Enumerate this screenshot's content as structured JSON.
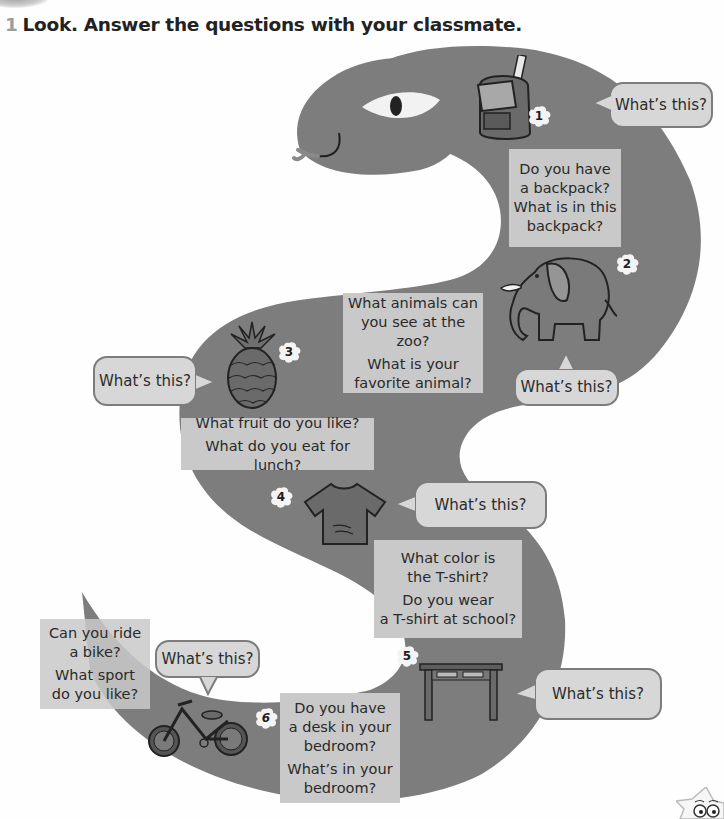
{
  "exercise": {
    "number": "1",
    "instruction": "Look. Answer the questions with your classmate."
  },
  "colors": {
    "snake_body": "#7d7d7d",
    "question_box": "#c9c9c9",
    "bubble_fill": "#d7d7d7",
    "bubble_border": "#7c7c7c",
    "number_color": "#9d9d9d"
  },
  "stations": [
    {
      "number": "1",
      "item": "backpack",
      "bubble": "What’s this?",
      "questions": [
        "Do you have a backpack? What is in this backpack?"
      ]
    },
    {
      "number": "2",
      "item": "elephant",
      "bubble": "What’s this?",
      "questions": [
        "What animals can you see at the zoo?",
        "What is your favorite animal?"
      ]
    },
    {
      "number": "3",
      "item": "pineapple",
      "bubble": "What’s this?",
      "questions": [
        "What fruit do you like?",
        "What do you eat for lunch?"
      ]
    },
    {
      "number": "4",
      "item": "t-shirt",
      "bubble": "What’s this?",
      "questions": [
        "What color is the T-shirt?",
        "Do you wear a T-shirt at school?"
      ]
    },
    {
      "number": "5",
      "item": "desk",
      "bubble": "What’s this?",
      "questions": [
        "Do you have a desk in your bedroom?",
        "What’s in your bedroom?"
      ]
    },
    {
      "number": "6",
      "item": "bike",
      "bubble": "What’s this?",
      "questions": [
        "Can you ride a bike?",
        "What sport do you like?"
      ]
    }
  ],
  "box_lines": {
    "s1": [
      "Do you have",
      "a backpack?",
      "What is in this",
      "backpack?"
    ],
    "s2a": [
      "What animals can",
      "you see at the zoo?"
    ],
    "s2b": [
      "What is your",
      "favorite animal?"
    ],
    "s3a": [
      "What fruit do you like?"
    ],
    "s3b": [
      "What do you eat for lunch?"
    ],
    "s4a": [
      "What color is",
      "the T-shirt?"
    ],
    "s4b": [
      "Do you wear",
      "a T-shirt at school?"
    ],
    "s5a": [
      "Do you have",
      "a desk in your",
      "bedroom?"
    ],
    "s5b": [
      "What’s in your",
      "bedroom?"
    ],
    "s6a": [
      "Can you ride",
      "a bike?"
    ],
    "s6b": [
      "What sport",
      "do you like?"
    ]
  }
}
